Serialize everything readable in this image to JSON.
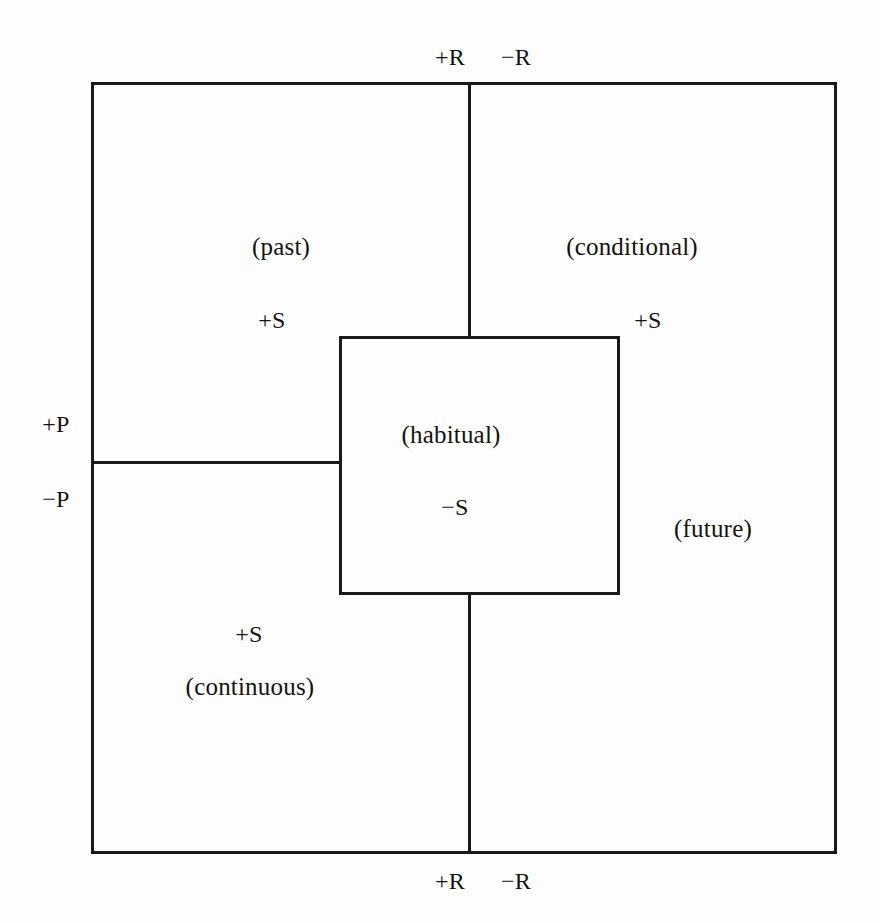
{
  "diagram": {
    "axis_labels": {
      "top_left": "+R",
      "top_right": "−R",
      "bottom_left": "+R",
      "bottom_right": "−R",
      "left_upper": "+P",
      "left_lower": "−P"
    },
    "cells": [
      {
        "id": "past",
        "term": "(past)",
        "sign": "+S",
        "quadrant": "top-left"
      },
      {
        "id": "conditional",
        "term": "(conditional)",
        "sign": "+S",
        "quadrant": "top-right"
      },
      {
        "id": "habitual",
        "term": "(habitual)",
        "sign": "−S",
        "quadrant": "center"
      },
      {
        "id": "future",
        "term": "(future)",
        "sign": "",
        "quadrant": "bottom-right"
      },
      {
        "id": "continuous",
        "term": "(continuous)",
        "sign": "+S",
        "quadrant": "bottom-left"
      }
    ],
    "colors": {
      "ink": "#1b1a17",
      "paper": "#fdfdfd"
    }
  }
}
